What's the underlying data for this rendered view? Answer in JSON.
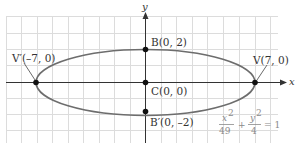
{
  "figure": {
    "type": "ellipse-diagram",
    "axes": {
      "x_label": "x",
      "y_label": "y"
    },
    "grid": {
      "x_min": -9,
      "x_max": 8.5,
      "y_min": -4,
      "y_max": 4,
      "step": 1
    },
    "ellipse": {
      "a": 7,
      "b": 2,
      "center": [
        0,
        0
      ],
      "color": "#6d6d6d"
    },
    "points": [
      {
        "id": "V",
        "name": "V",
        "coords": "(7, 0)",
        "label": "V(7, 0)",
        "x": 7,
        "y": 0
      },
      {
        "id": "V_prime",
        "name": "V'",
        "coords": "(–7, 0)",
        "label": "V′(–7, 0)",
        "x": -7,
        "y": 0
      },
      {
        "id": "B",
        "name": "B",
        "coords": "(0, 2)",
        "label": "B(0, 2)",
        "x": 0,
        "y": 2
      },
      {
        "id": "B_prime",
        "name": "B'",
        "coords": "(0, –2)",
        "label": "B′(0, –2)",
        "x": 0,
        "y": -2
      },
      {
        "id": "C",
        "name": "C",
        "coords": "(0, 0)",
        "label": "C(0, 0)",
        "x": 0,
        "y": 0
      }
    ],
    "equation": {
      "text": "x²/49 + y²/4 = 1",
      "term1_num": "x",
      "term1_exp": "2",
      "term1_den": "49",
      "plus": "+",
      "term2_num": "y",
      "term2_exp": "2",
      "term2_den": "4",
      "equals": "= 1"
    },
    "colors": {
      "grid": "#d9d9d9",
      "axis": "#333333",
      "curve": "#6d6d6d",
      "point": "#111111",
      "equation": "#8a8a8a"
    }
  }
}
